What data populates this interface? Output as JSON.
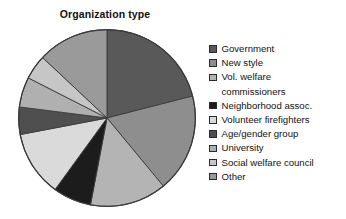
{
  "chart_data": {
    "type": "pie",
    "title": "Organization type",
    "xlabel": "",
    "ylabel": "",
    "grid": false,
    "legend_position": "right",
    "start_angle_deg": 0,
    "direction": "clockwise",
    "categories": [
      "Government",
      "New style",
      "Vol. welfare commissioners",
      "Neighborhood assoc.",
      "Volunteer firefighters",
      "Age/gender group",
      "University",
      "Social welfare council",
      "Other"
    ],
    "values": [
      21.0,
      18.0,
      14.0,
      7.0,
      12.0,
      5.0,
      5.5,
      4.5,
      13.0
    ],
    "unit": "percent",
    "slices": [
      {
        "label": "Government",
        "value": 21.0,
        "color": "#595959",
        "start_deg": 0.0,
        "end_deg": 75.6
      },
      {
        "label": "New style",
        "value": 18.0,
        "color": "#8e8e8e",
        "start_deg": 75.6,
        "end_deg": 140.4
      },
      {
        "label": "Vol. welfare commissioners",
        "value": 14.0,
        "color": "#b4b4b4",
        "start_deg": 140.4,
        "end_deg": 190.8
      },
      {
        "label": "Neighborhood assoc.",
        "value": 7.0,
        "color": "#1c1c1c",
        "start_deg": 190.8,
        "end_deg": 216.0
      },
      {
        "label": "Volunteer firefighters",
        "value": 12.0,
        "color": "#dadada",
        "start_deg": 216.0,
        "end_deg": 259.2
      },
      {
        "label": "Age/gender group",
        "value": 5.0,
        "color": "#4f4f4f",
        "start_deg": 259.2,
        "end_deg": 277.2
      },
      {
        "label": "University",
        "value": 5.5,
        "color": "#b0b0b0",
        "start_deg": 277.2,
        "end_deg": 297.0
      },
      {
        "label": "Social welfare council",
        "value": 4.5,
        "color": "#c6c6c6",
        "start_deg": 297.0,
        "end_deg": 313.2
      },
      {
        "label": "Other",
        "value": 13.0,
        "color": "#9a9a9a",
        "start_deg": 313.2,
        "end_deg": 360.0
      }
    ]
  },
  "legend": {
    "items": [
      {
        "label": "Government",
        "swatch": "#595959",
        "continuation": null
      },
      {
        "label": "New style",
        "swatch": "#8e8e8e",
        "continuation": null
      },
      {
        "label": "Vol. welfare",
        "swatch": "#b4b4b4",
        "continuation": "commissioners"
      },
      {
        "label": "Neighborhood assoc.",
        "swatch": "#1c1c1c",
        "continuation": null
      },
      {
        "label": "Volunteer firefighters",
        "swatch": "#dadada",
        "continuation": null
      },
      {
        "label": "Age/gender group",
        "swatch": "#4f4f4f",
        "continuation": null
      },
      {
        "label": "University",
        "swatch": "#b0b0b0",
        "continuation": null
      },
      {
        "label": "Social welfare council",
        "swatch": "#c6c6c6",
        "continuation": null
      },
      {
        "label": "Other",
        "swatch": "#9a9a9a",
        "continuation": null
      }
    ]
  },
  "colors": {
    "background": "#ffffff",
    "text": "#121212",
    "slice_outline": "#3a3a3a"
  }
}
